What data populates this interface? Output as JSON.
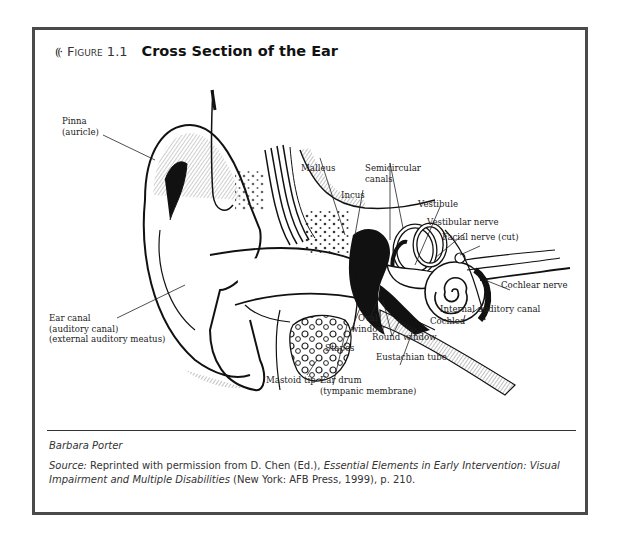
{
  "figure": {
    "icon": "sound-waves-icon",
    "icon_glyph": "((·",
    "number": "Figure 1.1",
    "title": "Cross Section of the Ear"
  },
  "labels": {
    "pinna": [
      "Pinna",
      "(auricle)"
    ],
    "malleus": "Malleus",
    "semicircular_canals": [
      "Semicircular",
      "canals"
    ],
    "incus": "Incus",
    "vestibule": "Vestibule",
    "vestibular_nerve": "Vestibular nerve",
    "facial_nerve": "Facial nerve (cut)",
    "cochlear_nerve": "Cochlear nerve",
    "internal_auditory_canal": "Internal auditory canal",
    "cochlea": "Cochlea",
    "ear_canal": [
      "Ear canal",
      "(auditory canal)",
      "(external auditory meatus)"
    ],
    "oval_window": [
      "Oval",
      "window"
    ],
    "round_window": "Round window",
    "stapes": "Stapes",
    "eustachian_tube": "Eustachian tube",
    "mastoid_tip": "Mastoid tip",
    "ear_drum": [
      "Ear drum",
      "(tympanic membrane)"
    ]
  },
  "credit": "Barbara Porter",
  "source": {
    "label": "Source:",
    "text1": " Reprinted with permission from D. Chen (Ed.), ",
    "book_title": "Essential Elements in Early Intervention: Visual Impairment and Multiple Disabilities",
    "text2": " (New York: AFB Press, 1999), p. 210."
  },
  "colors": {
    "frame_border": "#4a4a4a",
    "ink": "#111111"
  }
}
